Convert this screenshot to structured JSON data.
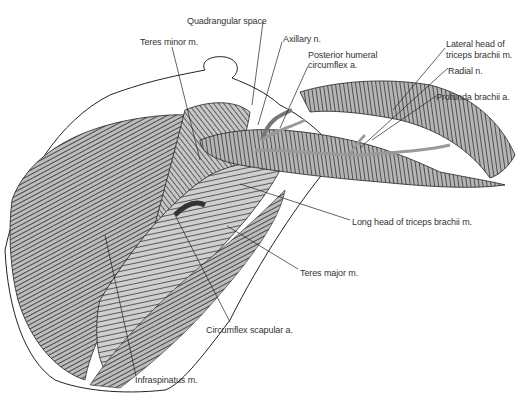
{
  "figure": {
    "labels": [
      {
        "id": "quadrangular-space",
        "text": "Quadrangular space",
        "x": 187,
        "y": 16
      },
      {
        "id": "teres-minor",
        "text": "Teres minor m.",
        "x": 140,
        "y": 37
      },
      {
        "id": "axillary-n",
        "text": "Axillary n.",
        "x": 283,
        "y": 34
      },
      {
        "id": "posterior-humeral-circumflex-1",
        "text": "Posterior humeral",
        "x": 308,
        "y": 50
      },
      {
        "id": "posterior-humeral-circumflex-2",
        "text": "circumflex a.",
        "x": 308,
        "y": 60
      },
      {
        "id": "lateral-head-triceps-1",
        "text": "Lateral head of",
        "x": 446,
        "y": 39
      },
      {
        "id": "lateral-head-triceps-2",
        "text": "triceps brachii m.",
        "x": 446,
        "y": 50
      },
      {
        "id": "radial-n",
        "text": "Radial n.",
        "x": 448,
        "y": 66
      },
      {
        "id": "profunda-brachii",
        "text": "Profunda brachii a.",
        "x": 436,
        "y": 92
      },
      {
        "id": "long-head-triceps",
        "text": "Long head of triceps brachii m.",
        "x": 352,
        "y": 217
      },
      {
        "id": "teres-major",
        "text": "Teres major m.",
        "x": 300,
        "y": 268
      },
      {
        "id": "circumflex-scapular",
        "text": "Circumflex scapular a.",
        "x": 206,
        "y": 325
      },
      {
        "id": "infraspinatus",
        "text": "Infraspinatus m.",
        "x": 135,
        "y": 375
      }
    ]
  }
}
